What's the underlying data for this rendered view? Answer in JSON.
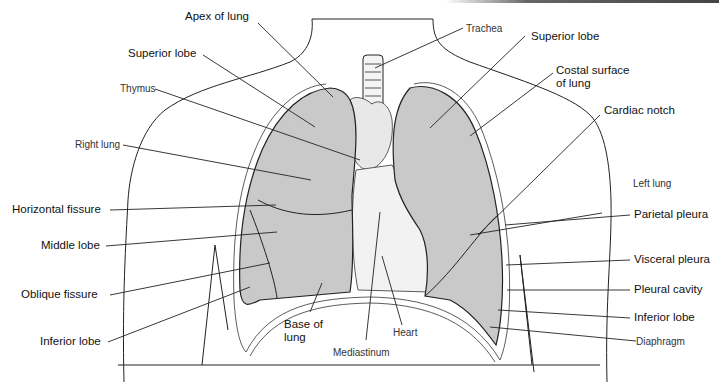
{
  "figure": {
    "colors": {
      "lung_fill": "#c9c9c9",
      "line": "#222222",
      "background": "#ffffff"
    }
  },
  "labels": {
    "apex_of_lung": "Apex of lung",
    "superior_lobe_right": "Superior lobe",
    "thymus": "Thymus",
    "right_lung": "Right lung",
    "horizontal_fissure": "Horizontal fissure",
    "middle_lobe": "Middle lobe",
    "oblique_fissure": "Oblique fissure",
    "inferior_lobe_right": "Inferior lobe",
    "base_of_lung_1": "Base of",
    "base_of_lung_2": "lung",
    "mediastinum": "Mediastinum",
    "heart": "Heart",
    "trachea": "Trachea",
    "superior_lobe_left": "Superior lobe",
    "costal_surface_1": "Costal surface",
    "costal_surface_2": "of lung",
    "cardiac_notch": "Cardiac notch",
    "left_lung": "Left lung",
    "parietal_pleura": "Parietal pleura",
    "visceral_pleura": "Visceral pleura",
    "pleural_cavity": "Pleural cavity",
    "inferior_lobe_left": "Inferior lobe",
    "diaphragm": "Diaphragm"
  }
}
